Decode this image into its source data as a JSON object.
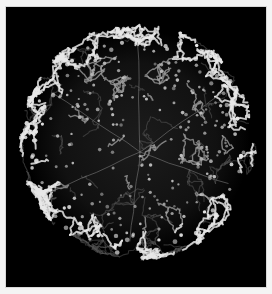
{
  "image": {
    "subject": "spherical mesh shell structure",
    "description": "Grayscale 3D rendering of a roughly spherical lattice of tangled filaments on a black background",
    "colors": {
      "page_background": "#f4f4f4",
      "frame_background": "#000000",
      "filament_bright": "#e8e8e8",
      "filament_mid": "#9a9a9a",
      "filament_dim": "#555555"
    },
    "sphere": {
      "cx": 132,
      "cy": 135,
      "r": 117
    }
  }
}
